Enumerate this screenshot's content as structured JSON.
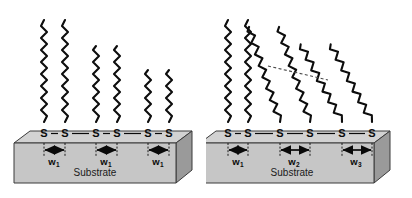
{
  "figure": {
    "type": "schematic-diagram",
    "panel_count": 2
  },
  "labels": {
    "sulfur": "S",
    "substrate": "Substrate",
    "bond_dash": "—"
  },
  "colors": {
    "chain": "#0d0d0d",
    "halo": "#d9d9d9",
    "substrate_top": "#d2d2d2",
    "substrate_front": "#c6c6c6",
    "substrate_side": "#9a9a9a",
    "substrate_edge": "#3a3a3a",
    "arrow": "#0a0a0a",
    "tilt_guide": "#4a4a4a",
    "background": "#ffffff"
  },
  "panels": [
    {
      "id": "left",
      "name": "uniform-spacing-vertical-chains",
      "substrate_label": "Substrate",
      "sulfur_labels": [
        "S",
        "S",
        "S",
        "S",
        "S",
        "S"
      ],
      "chains": [
        {
          "id": "L1",
          "x": 44,
          "height": 108,
          "tilt_deg": 0,
          "label": "chain"
        },
        {
          "id": "L2",
          "x": 65,
          "height": 108,
          "tilt_deg": 0,
          "label": "chain"
        },
        {
          "id": "L3",
          "x": 96,
          "height": 80,
          "tilt_deg": 0,
          "label": "chain"
        },
        {
          "id": "L4",
          "x": 117,
          "height": 80,
          "tilt_deg": 0,
          "label": "chain"
        },
        {
          "id": "L5",
          "x": 148,
          "height": 58,
          "tilt_deg": 0,
          "label": "chain"
        },
        {
          "id": "L6",
          "x": 169,
          "height": 58,
          "tilt_deg": 0,
          "label": "chain"
        }
      ],
      "measurements": [
        {
          "id": "w1a",
          "text": "w",
          "sub": "1",
          "x1": 44,
          "x2": 65,
          "label_x": 54
        },
        {
          "id": "w1b",
          "text": "w",
          "sub": "1",
          "x1": 96,
          "x2": 117,
          "label_x": 106
        },
        {
          "id": "w1c",
          "text": "w",
          "sub": "1",
          "x1": 148,
          "x2": 169,
          "label_x": 158
        }
      ],
      "tilt_guide": null
    },
    {
      "id": "right",
      "name": "varied-spacing-tilted-chains",
      "substrate_label": "Substrate",
      "sulfur_labels": [
        "S",
        "S",
        "S",
        "S",
        "S",
        "S"
      ],
      "chains": [
        {
          "id": "R1",
          "x": 22,
          "height": 108,
          "tilt_deg": 0,
          "label": "chain"
        },
        {
          "id": "R2",
          "x": 42,
          "height": 108,
          "tilt_deg": 0,
          "label": "chain"
        },
        {
          "id": "R3",
          "x": 74,
          "height": 106,
          "tilt_deg": 18,
          "label": "chain"
        },
        {
          "id": "R4",
          "x": 104,
          "height": 106,
          "tilt_deg": 18,
          "label": "chain"
        },
        {
          "id": "R5",
          "x": 136,
          "height": 100,
          "tilt_deg": 28,
          "label": "chain"
        },
        {
          "id": "R6",
          "x": 166,
          "height": 100,
          "tilt_deg": 28,
          "label": "chain"
        }
      ],
      "measurements": [
        {
          "id": "w1",
          "text": "w",
          "sub": "1",
          "x1": 22,
          "x2": 42,
          "label_x": 32
        },
        {
          "id": "w2",
          "text": "w",
          "sub": "2",
          "x1": 74,
          "x2": 104,
          "label_x": 89
        },
        {
          "id": "w3",
          "text": "w",
          "sub": "3",
          "x1": 136,
          "x2": 166,
          "label_x": 151
        }
      ],
      "tilt_guide": {
        "x1": 62,
        "y1": 66,
        "x2": 122,
        "y2": 80,
        "style": "dashed"
      }
    }
  ]
}
